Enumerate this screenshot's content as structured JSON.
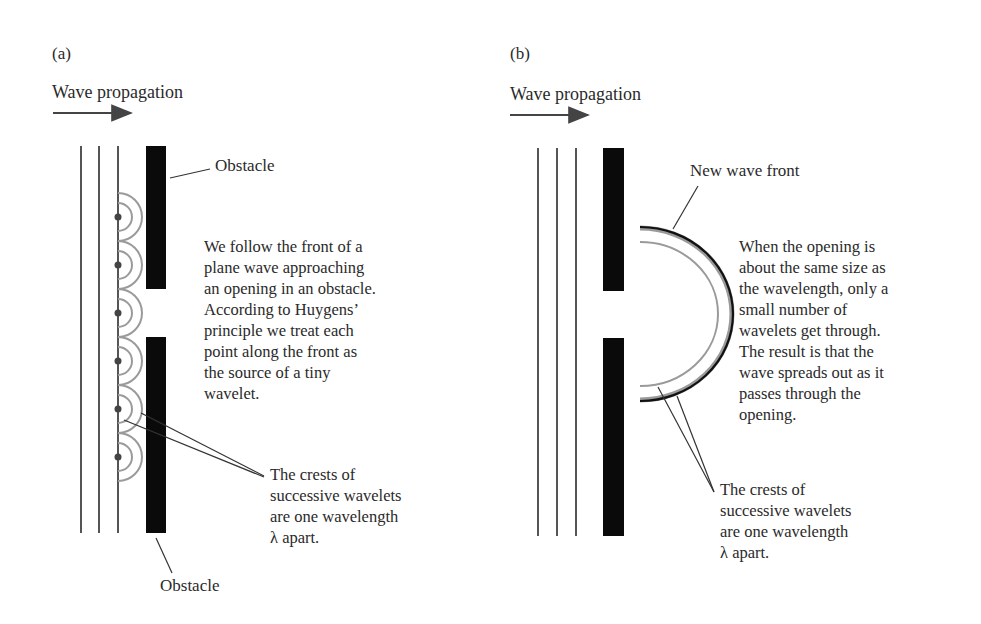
{
  "panel_a": {
    "label": "(a)",
    "title": "Wave propagation",
    "obstacle_top_label": "Obstacle",
    "obstacle_bottom_label": "Obstacle",
    "description": "We follow the front of a\nplane wave approaching\nan opening in an obstacle.\nAccording to Huygens’\nprinciple we treat each\npoint along the front as\nthe source of a tiny\nwavelet.",
    "crests_note": "The crests of\nsuccessive wavelets\nare one wavelength\nλ apart."
  },
  "panel_b": {
    "label": "(b)",
    "title": "Wave propagation",
    "new_front_label": "New wave front",
    "description": "When the opening is\nabout the same size as\nthe wavelength, only a\nsmall number of\nwavelets get through.\nThe result is that the\nwave spreads out as it\npasses through the\nopening.",
    "crests_note": "The crests of\nsuccessive wavelets\nare one wavelength\nλ apart."
  },
  "colors": {
    "ink": "#2a2a2a",
    "obstacle": "#0a0a0a",
    "wavelet": "#9a9a9a",
    "wave_line": "#555555"
  }
}
